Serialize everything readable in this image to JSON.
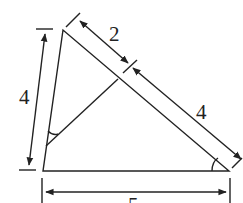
{
  "diagram": {
    "type": "geometry-triangle",
    "labels": {
      "left_side": "4",
      "hyp_upper": "2",
      "hyp_lower": "4",
      "base": "5"
    },
    "colors": {
      "stroke": "#222222",
      "background": "#ffffff"
    }
  }
}
